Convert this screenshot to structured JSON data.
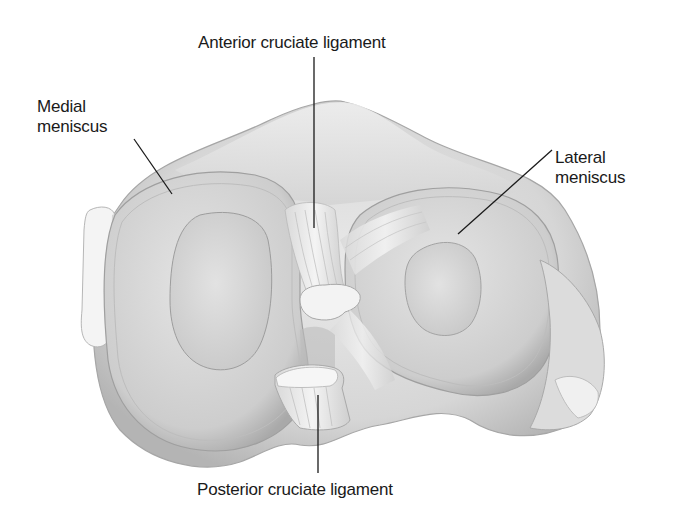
{
  "figure": {
    "colors": {
      "background": "#ffffff",
      "tissue_light": "#ececec",
      "tissue_mid": "#cfcfcf",
      "tissue_shadow": "#9a9a9a",
      "leader_line": "#1a1a1a",
      "label_text": "#1a1a1a"
    },
    "labels": {
      "acl": "Anterior cruciate ligament",
      "medial": {
        "line1": "Medial",
        "line2": "meniscus"
      },
      "lateral": {
        "line1": "Lateral",
        "line2": "meniscus"
      },
      "pcl": "Posterior cruciate ligament"
    }
  }
}
